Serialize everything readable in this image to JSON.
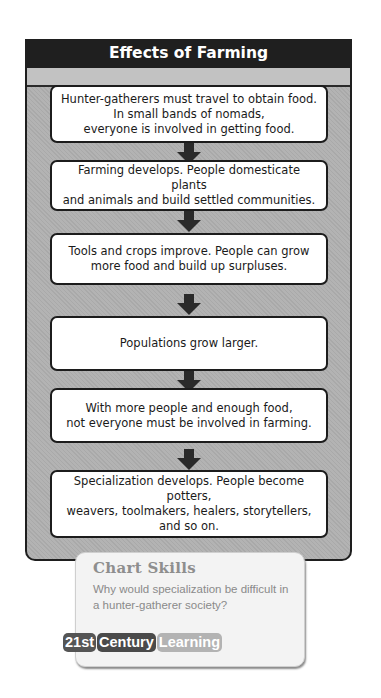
{
  "chart": {
    "title": "Effects of Farming",
    "steps": [
      {
        "text": "Hunter-gatherers must travel to obtain food.\nIn small bands of nomads,\neveryone is involved in getting food."
      },
      {
        "text": "Farming develops. People domesticate plants\nand animals and build settled communities."
      },
      {
        "text": "Tools and crops improve. People can grow\nmore food and build up surpluses."
      },
      {
        "text": "Populations grow larger."
      },
      {
        "text": "With more people and enough food,\nnot everyone must be involved in farming."
      },
      {
        "text": "Specialization develops. People become potters,\nweavers, toolmakers, healers, storytellers,\nand so on."
      }
    ],
    "arrow_icon": "down-arrow-icon"
  },
  "skills": {
    "title": "Chart Skills",
    "question": "Why would specialization be difficult in a hunter-gatherer society?",
    "badge": [
      "21st",
      "Century",
      "Learning"
    ]
  },
  "colors": {
    "header_bg": "#1f1f1f",
    "panel_bg": "#afafaf",
    "box_bg": "#ffffff",
    "border": "#1c1c1c"
  }
}
